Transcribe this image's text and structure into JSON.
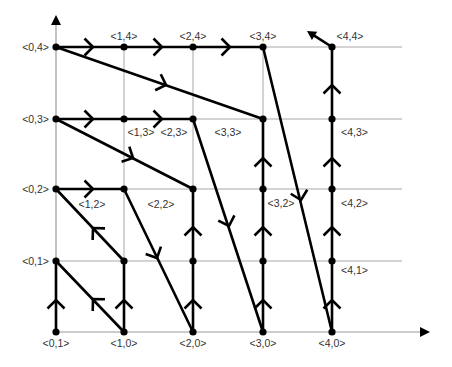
{
  "diagram": {
    "title": "",
    "grid": {
      "x": [
        56,
        124,
        193,
        263,
        332
      ],
      "y": [
        332,
        261,
        189,
        119,
        47
      ],
      "x_extent": 402,
      "y_top_extent": 47
    },
    "axes": {
      "x_axis": {
        "from": [
          56,
          332
        ],
        "to": [
          430,
          332
        ]
      },
      "y_axis": {
        "from": [
          56,
          332
        ],
        "to": [
          56,
          15
        ]
      }
    },
    "nodes": [
      {
        "id": "0,0",
        "label": "<0,1>",
        "gx": 0,
        "gy": 0,
        "lx": 56,
        "ly": 347,
        "anchor": "middle"
      },
      {
        "id": "1,0",
        "label": "<1,0>",
        "gx": 1,
        "gy": 0,
        "lx": 124,
        "ly": 347,
        "anchor": "middle"
      },
      {
        "id": "2,0",
        "label": "<2,0>",
        "gx": 2,
        "gy": 0,
        "lx": 193,
        "ly": 347,
        "anchor": "middle"
      },
      {
        "id": "3,0",
        "label": "<3,0>",
        "gx": 3,
        "gy": 0,
        "lx": 263,
        "ly": 347,
        "anchor": "middle"
      },
      {
        "id": "4,0",
        "label": "<4,0>",
        "gx": 4,
        "gy": 0,
        "lx": 332,
        "ly": 347,
        "anchor": "middle"
      },
      {
        "id": "0,1",
        "label": "<0,1>",
        "gx": 0,
        "gy": 1,
        "lx": 49,
        "ly": 265,
        "anchor": "end"
      },
      {
        "id": "1,1",
        "label": "",
        "gx": 1,
        "gy": 1
      },
      {
        "id": "2,1",
        "label": "",
        "gx": 2,
        "gy": 1
      },
      {
        "id": "3,1",
        "label": "",
        "gx": 3,
        "gy": 1
      },
      {
        "id": "4,1",
        "label": "<4,1>",
        "gx": 4,
        "gy": 1,
        "lx": 341,
        "ly": 274,
        "anchor": "start"
      },
      {
        "id": "0,2",
        "label": "<0,2>",
        "gx": 0,
        "gy": 2,
        "lx": 49,
        "ly": 193,
        "anchor": "end"
      },
      {
        "id": "1,2",
        "label": "<1,2>",
        "gx": 1,
        "gy": 2,
        "lx": 92,
        "ly": 208,
        "anchor": "middle"
      },
      {
        "id": "2,2",
        "label": "<2,2>",
        "gx": 2,
        "gy": 2,
        "lx": 161,
        "ly": 208,
        "anchor": "middle"
      },
      {
        "id": "3,2",
        "label": "<3,2>",
        "gx": 3,
        "gy": 2,
        "lx": 281,
        "ly": 207,
        "anchor": "middle"
      },
      {
        "id": "4,2",
        "label": "<4,2>",
        "gx": 4,
        "gy": 2,
        "lx": 341,
        "ly": 207,
        "anchor": "start"
      },
      {
        "id": "0,3",
        "label": "<0,3>",
        "gx": 0,
        "gy": 3,
        "lx": 49,
        "ly": 123,
        "anchor": "end"
      },
      {
        "id": "1,3",
        "label": "<1,3>",
        "gx": 1,
        "gy": 3,
        "lx": 141,
        "ly": 136,
        "anchor": "middle"
      },
      {
        "id": "2,3",
        "label": "<2,3>",
        "gx": 2,
        "gy": 3,
        "lx": 174,
        "ly": 136,
        "anchor": "middle"
      },
      {
        "id": "3,3",
        "label": "<3,3>",
        "gx": 3,
        "gy": 3,
        "lx": 228,
        "ly": 136,
        "anchor": "middle"
      },
      {
        "id": "4,3",
        "label": "<4,3>",
        "gx": 4,
        "gy": 3,
        "lx": 341,
        "ly": 136,
        "anchor": "start"
      },
      {
        "id": "0,4",
        "label": "<0,4>",
        "gx": 0,
        "gy": 4,
        "lx": 49,
        "ly": 51,
        "anchor": "end"
      },
      {
        "id": "1,4",
        "label": "<1,4>",
        "gx": 1,
        "gy": 4,
        "lx": 124,
        "ly": 40,
        "anchor": "middle"
      },
      {
        "id": "2,4",
        "label": "<2,4>",
        "gx": 2,
        "gy": 4,
        "lx": 193,
        "ly": 40,
        "anchor": "middle"
      },
      {
        "id": "3,4",
        "label": "<3,4>",
        "gx": 3,
        "gy": 4,
        "lx": 263,
        "ly": 40,
        "anchor": "middle"
      },
      {
        "id": "4,4",
        "label": "<4,4>",
        "gx": 4,
        "gy": 4,
        "lx": 350,
        "ly": 40,
        "anchor": "middle"
      }
    ],
    "edges": [
      {
        "from": [
          56,
          47
        ],
        "to": [
          263,
          47
        ],
        "arrows": [
          [
            93,
            47
          ],
          [
            162,
            47
          ],
          [
            230,
            47
          ]
        ]
      },
      {
        "from": [
          56,
          47
        ],
        "to": [
          263,
          119
        ],
        "arrows": [
          [
            166,
            85
          ]
        ]
      },
      {
        "from": [
          263,
          47
        ],
        "to": [
          332,
          332
        ],
        "arrows": [
          [
            301,
            200
          ]
        ]
      },
      {
        "from": [
          56,
          119
        ],
        "to": [
          193,
          119
        ],
        "arrows": [
          [
            93,
            119
          ],
          [
            162,
            119
          ]
        ]
      },
      {
        "from": [
          56,
          119
        ],
        "to": [
          193,
          189
        ],
        "arrows": [
          [
            133,
            158
          ]
        ]
      },
      {
        "from": [
          193,
          119
        ],
        "to": [
          263,
          332
        ],
        "arrows": [
          [
            229,
            226
          ]
        ]
      },
      {
        "from": [
          56,
          189
        ],
        "to": [
          124,
          189
        ],
        "arrows": [
          [
            93,
            189
          ]
        ]
      },
      {
        "from": [
          124,
          261
        ],
        "to": [
          56,
          189
        ],
        "arrows": [
          [
            93,
            228
          ]
        ]
      },
      {
        "from": [
          124,
          189
        ],
        "to": [
          193,
          332
        ],
        "arrows": [
          [
            157,
            258
          ]
        ]
      },
      {
        "from": [
          124,
          332
        ],
        "to": [
          56,
          261
        ],
        "arrows": [
          [
            93,
            299
          ]
        ]
      },
      {
        "from": [
          56,
          332
        ],
        "to": [
          56,
          261
        ],
        "arrows": [
          [
            56,
            300
          ]
        ]
      },
      {
        "from": [
          124,
          332
        ],
        "to": [
          124,
          261
        ],
        "arrows": [
          [
            124,
            300
          ]
        ]
      },
      {
        "from": [
          193,
          332
        ],
        "to": [
          193,
          189
        ],
        "arrows": [
          [
            193,
            300
          ],
          [
            193,
            227
          ]
        ]
      },
      {
        "from": [
          263,
          332
        ],
        "to": [
          263,
          119
        ],
        "arrows": [
          [
            263,
            300
          ],
          [
            263,
            227
          ],
          [
            263,
            158
          ]
        ]
      },
      {
        "from": [
          332,
          332
        ],
        "to": [
          332,
          47
        ],
        "arrows": [
          [
            332,
            300
          ],
          [
            332,
            227
          ],
          [
            332,
            158
          ],
          [
            332,
            85
          ]
        ]
      },
      {
        "from": [
          332,
          47
        ],
        "to": [
          307,
          31
        ],
        "arrows": [],
        "head": true
      }
    ]
  }
}
